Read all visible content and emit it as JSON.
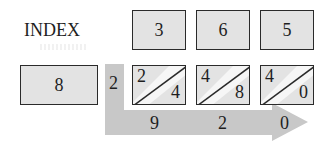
{
  "diagram": {
    "title": "INDEX",
    "index_value": "8",
    "top_digits": [
      "3",
      "6",
      "5"
    ],
    "carry_in": "2",
    "products": [
      {
        "tens": "2",
        "ones": "4"
      },
      {
        "tens": "4",
        "ones": "8"
      },
      {
        "tens": "4",
        "ones": "0"
      }
    ],
    "result_digits": [
      "9",
      "2",
      "0"
    ],
    "colors": {
      "box_fill": "#e3e3e3",
      "box_border": "#2a2a2a",
      "arrow_fill": "#c8c8c8",
      "text": "#1e1e1e"
    }
  }
}
